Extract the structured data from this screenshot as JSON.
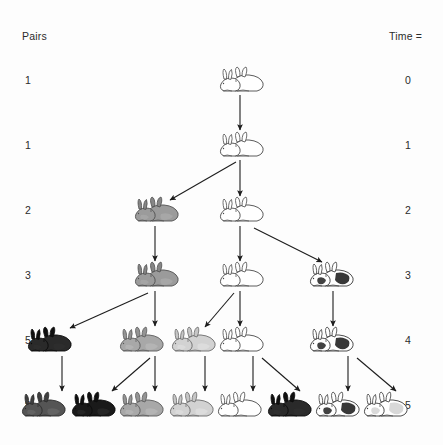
{
  "figure": {
    "type": "diagram",
    "background_color": "#fdfdfd",
    "ink_color": "#231f20"
  },
  "header": {
    "left_label": "Pairs",
    "right_label": "Time ="
  },
  "rows": [
    {
      "pairs": "1",
      "time": "0",
      "y": 80,
      "count": 1
    },
    {
      "pairs": "1",
      "time": "1",
      "y": 145,
      "count": 1
    },
    {
      "pairs": "2",
      "time": "2",
      "y": 210,
      "count": 2
    },
    {
      "pairs": "3",
      "time": "3",
      "y": 275,
      "count": 3
    },
    {
      "pairs": "5",
      "time": "4",
      "y": 340,
      "count": 5
    },
    {
      "pairs": "8",
      "time": "5",
      "y": 405,
      "count": 8
    }
  ],
  "pairs_column": [
    "1",
    "1",
    "2",
    "3",
    "5",
    "8"
  ],
  "time_column": [
    "0",
    "1",
    "2",
    "3",
    "4",
    "5"
  ],
  "rabbits": [
    {
      "id": "r0-0",
      "row": 0,
      "x": 240,
      "y": 80,
      "shade": "white",
      "fill": "#ffffff"
    },
    {
      "id": "r1-0",
      "row": 1,
      "x": 240,
      "y": 145,
      "shade": "white",
      "fill": "#ffffff"
    },
    {
      "id": "r2-0",
      "row": 2,
      "x": 155,
      "y": 210,
      "shade": "gray",
      "fill": "#9b9b9b"
    },
    {
      "id": "r2-1",
      "row": 2,
      "x": 240,
      "y": 210,
      "shade": "white",
      "fill": "#ffffff"
    },
    {
      "id": "r3-0",
      "row": 3,
      "x": 155,
      "y": 275,
      "shade": "gray",
      "fill": "#9b9b9b"
    },
    {
      "id": "r3-1",
      "row": 3,
      "x": 240,
      "y": 275,
      "shade": "white",
      "fill": "#ffffff"
    },
    {
      "id": "r3-2",
      "row": 3,
      "x": 330,
      "y": 275,
      "shade": "spotted",
      "fill": "#ffffff"
    },
    {
      "id": "r4-0",
      "row": 4,
      "x": 48,
      "y": 340,
      "shade": "black",
      "fill": "#2a2a2a"
    },
    {
      "id": "r4-1",
      "row": 4,
      "x": 140,
      "y": 340,
      "shade": "midgray",
      "fill": "#a8a8a8"
    },
    {
      "id": "r4-2",
      "row": 4,
      "x": 192,
      "y": 340,
      "shade": "lightgray",
      "fill": "#d2d2d2"
    },
    {
      "id": "r4-3",
      "row": 4,
      "x": 240,
      "y": 340,
      "shade": "white",
      "fill": "#ffffff"
    },
    {
      "id": "r4-4",
      "row": 4,
      "x": 330,
      "y": 340,
      "shade": "spotted",
      "fill": "#ffffff"
    },
    {
      "id": "r5-0",
      "row": 5,
      "x": 42,
      "y": 405,
      "shade": "darkgray",
      "fill": "#555555"
    },
    {
      "id": "r5-1",
      "row": 5,
      "x": 92,
      "y": 405,
      "shade": "black",
      "fill": "#1a1a1a"
    },
    {
      "id": "r5-2",
      "row": 5,
      "x": 140,
      "y": 405,
      "shade": "midgray",
      "fill": "#a8a8a8"
    },
    {
      "id": "r5-3",
      "row": 5,
      "x": 190,
      "y": 405,
      "shade": "lightgray",
      "fill": "#d2d2d2"
    },
    {
      "id": "r5-4",
      "row": 5,
      "x": 238,
      "y": 405,
      "shade": "white",
      "fill": "#ffffff"
    },
    {
      "id": "r5-5",
      "row": 5,
      "x": 288,
      "y": 405,
      "shade": "black",
      "fill": "#2a2a2a"
    },
    {
      "id": "r5-6",
      "row": 5,
      "x": 336,
      "y": 405,
      "shade": "spotted",
      "fill": "#ffffff"
    },
    {
      "id": "r5-7",
      "row": 5,
      "x": 384,
      "y": 405,
      "shade": "spotted2",
      "fill": "#ffffff"
    }
  ],
  "arrows": [
    {
      "from": "r0-0",
      "to": "r1-0",
      "x1": 240,
      "y1": 95,
      "x2": 240,
      "y2": 130,
      "kind": "vertical-survive"
    },
    {
      "from": "r1-0",
      "to": "r2-1",
      "x1": 240,
      "y1": 160,
      "x2": 240,
      "y2": 196,
      "kind": "vertical-survive"
    },
    {
      "from": "r1-0",
      "to": "r2-0",
      "x1": 236,
      "y1": 162,
      "x2": 170,
      "y2": 200,
      "kind": "diagonal-offspring"
    },
    {
      "from": "r2-0",
      "to": "r3-0",
      "x1": 155,
      "y1": 226,
      "x2": 155,
      "y2": 261,
      "kind": "vertical-survive"
    },
    {
      "from": "r2-1",
      "to": "r3-1",
      "x1": 240,
      "y1": 226,
      "x2": 240,
      "y2": 261,
      "kind": "vertical-survive"
    },
    {
      "from": "r2-1",
      "to": "r3-2",
      "x1": 254,
      "y1": 228,
      "x2": 322,
      "y2": 262,
      "kind": "diagonal-offspring"
    },
    {
      "from": "r3-0",
      "to": "r4-1",
      "x1": 155,
      "y1": 291,
      "x2": 155,
      "y2": 326,
      "kind": "vertical-survive"
    },
    {
      "from": "r3-0",
      "to": "r4-0",
      "x1": 148,
      "y1": 293,
      "x2": 70,
      "y2": 328,
      "kind": "diagonal-offspring"
    },
    {
      "from": "r3-1",
      "to": "r4-3",
      "x1": 240,
      "y1": 291,
      "x2": 240,
      "y2": 326,
      "kind": "vertical-survive"
    },
    {
      "from": "r3-1",
      "to": "r4-2",
      "x1": 234,
      "y1": 293,
      "x2": 205,
      "y2": 327,
      "kind": "diagonal-offspring"
    },
    {
      "from": "r3-2",
      "to": "r4-4",
      "x1": 333,
      "y1": 291,
      "x2": 333,
      "y2": 326,
      "kind": "vertical-survive"
    },
    {
      "from": "r4-0",
      "to": "r5-0",
      "x1": 62,
      "y1": 356,
      "x2": 62,
      "y2": 391,
      "kind": "vertical-survive"
    },
    {
      "from": "r4-1",
      "to": "r5-2",
      "x1": 155,
      "y1": 356,
      "x2": 155,
      "y2": 391,
      "kind": "vertical-survive"
    },
    {
      "from": "r4-1",
      "to": "r5-1",
      "x1": 150,
      "y1": 358,
      "x2": 112,
      "y2": 391,
      "kind": "diagonal-offspring"
    },
    {
      "from": "r4-2",
      "to": "r5-3",
      "x1": 205,
      "y1": 356,
      "x2": 205,
      "y2": 391,
      "kind": "vertical-survive"
    },
    {
      "from": "r4-3",
      "to": "r5-4",
      "x1": 253,
      "y1": 356,
      "x2": 253,
      "y2": 391,
      "kind": "vertical-survive"
    },
    {
      "from": "r4-3",
      "to": "r5-5",
      "x1": 262,
      "y1": 358,
      "x2": 300,
      "y2": 391,
      "kind": "diagonal-offspring"
    },
    {
      "from": "r4-4",
      "to": "r5-6",
      "x1": 348,
      "y1": 356,
      "x2": 348,
      "y2": 391,
      "kind": "vertical-survive"
    },
    {
      "from": "r4-4",
      "to": "r5-7",
      "x1": 357,
      "y1": 358,
      "x2": 396,
      "y2": 391,
      "kind": "diagonal-offspring"
    }
  ]
}
